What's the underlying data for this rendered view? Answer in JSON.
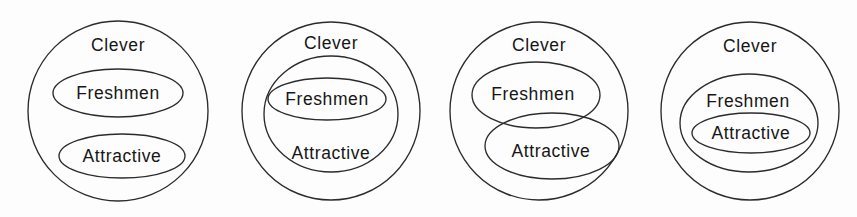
{
  "figure": {
    "background_color": "#fdfdfd",
    "line_color": "#2b2b2b",
    "text_color": "#161616",
    "labels": {
      "clever": "Clever",
      "freshmen": "Freshmen",
      "attractive": "Attractive"
    }
  },
  "diagrams": [
    {
      "id": "diagram-1",
      "relation": "Freshmen and Attractive are disjoint subsets of Clever",
      "shapes": {
        "clever": {
          "type": "circle",
          "cx": 118,
          "cy": 111,
          "r": 90
        },
        "freshmen": {
          "type": "ellipse",
          "cx": 118,
          "cy": 93,
          "rx": 65,
          "ry": 24
        },
        "attractive": {
          "type": "ellipse",
          "cx": 122,
          "cy": 156,
          "rx": 63,
          "ry": 22
        }
      },
      "label_positions": {
        "clever": {
          "x": 118,
          "y": 46
        },
        "freshmen": {
          "x": 118,
          "y": 94
        },
        "attractive": {
          "x": 122,
          "y": 157
        }
      }
    },
    {
      "id": "diagram-2",
      "relation": "Freshmen subset of Attractive subset of Clever",
      "shapes": {
        "clever": {
          "type": "circle",
          "cx": 331,
          "cy": 111,
          "r": 89
        },
        "attractive": {
          "type": "ellipse",
          "cx": 331,
          "cy": 114,
          "rx": 67,
          "ry": 58
        },
        "freshmen": {
          "type": "ellipse",
          "cx": 327,
          "cy": 99,
          "rx": 59,
          "ry": 21
        }
      },
      "label_positions": {
        "clever": {
          "x": 331,
          "y": 44
        },
        "freshmen": {
          "x": 327,
          "y": 100
        },
        "attractive": {
          "x": 331,
          "y": 154
        }
      }
    },
    {
      "id": "diagram-3",
      "relation": "Freshmen and Attractive overlap, both subsets of Clever",
      "shapes": {
        "clever": {
          "type": "circle",
          "cx": 539,
          "cy": 111,
          "r": 89
        },
        "freshmen": {
          "type": "ellipse",
          "cx": 536,
          "cy": 95,
          "rx": 64,
          "ry": 33
        },
        "attractive": {
          "type": "ellipse",
          "cx": 552,
          "cy": 146,
          "rx": 67,
          "ry": 33
        }
      },
      "label_positions": {
        "clever": {
          "x": 539,
          "y": 46
        },
        "freshmen": {
          "x": 533,
          "y": 95
        },
        "attractive": {
          "x": 551,
          "y": 152
        }
      }
    },
    {
      "id": "diagram-4",
      "relation": "Attractive subset of Freshmen subset of Clever",
      "shapes": {
        "clever": {
          "type": "circle",
          "cx": 750,
          "cy": 111,
          "r": 89
        },
        "freshmen": {
          "type": "ellipse",
          "cx": 749,
          "cy": 123,
          "rx": 69,
          "ry": 49
        },
        "attractive": {
          "type": "ellipse",
          "cx": 751,
          "cy": 133,
          "rx": 59,
          "ry": 20
        }
      },
      "label_positions": {
        "clever": {
          "x": 750,
          "y": 47
        },
        "freshmen": {
          "x": 748,
          "y": 102
        },
        "attractive": {
          "x": 751,
          "y": 134
        }
      }
    }
  ]
}
